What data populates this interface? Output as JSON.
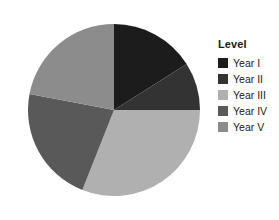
{
  "legend": {
    "title": "Level",
    "position": "right",
    "items": [
      {
        "label": "Year I",
        "color": "#1c1c1c"
      },
      {
        "label": "Year II",
        "color": "#333333"
      },
      {
        "label": "Year III",
        "color": "#b0b0b0"
      },
      {
        "label": "Year IV",
        "color": "#595959"
      },
      {
        "label": "Year V",
        "color": "#8c8c8c"
      }
    ]
  },
  "chart_data": {
    "type": "pie",
    "title": "",
    "legend_title": "Level",
    "legend_position": "right",
    "categories": [
      "Year I",
      "Year II",
      "Year III",
      "Year IV",
      "Year V"
    ],
    "values": [
      16,
      9,
      31,
      22,
      22
    ],
    "unit": "percent",
    "start_angle_deg": 0,
    "direction": "clockwise",
    "colors": [
      "#1c1c1c",
      "#333333",
      "#b0b0b0",
      "#595959",
      "#8c8c8c"
    ],
    "slice_angles_deg": [
      57.6,
      32.4,
      111.6,
      79.2,
      79.2
    ],
    "grid": false
  }
}
